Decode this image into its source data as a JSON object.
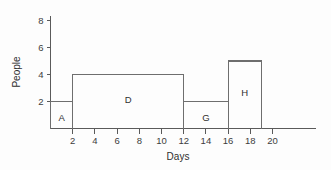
{
  "chart_data": {
    "type": "bar",
    "title": "",
    "subtitle": "",
    "xlabel": "Days",
    "ylabel": "People",
    "xlim": [
      0,
      21
    ],
    "ylim": [
      0,
      9
    ],
    "grid": false,
    "legend": false,
    "x_ticks": [
      2,
      4,
      6,
      8,
      10,
      12,
      14,
      16,
      18,
      20
    ],
    "x_tick_labels": [
      "2",
      "4",
      "6",
      "8",
      "10",
      "12",
      "14",
      "16",
      "18",
      "20"
    ],
    "y_ticks": [
      2,
      4,
      6,
      8
    ],
    "y_tick_labels": [
      "2",
      "4",
      "6",
      "8"
    ],
    "bars": [
      {
        "label": "A",
        "x_start": 0,
        "x_end": 2,
        "value": 2
      },
      {
        "label": "D",
        "x_start": 2,
        "x_end": 12,
        "value": 4
      },
      {
        "label": "G",
        "x_start": 12,
        "x_end": 16,
        "value": 2
      },
      {
        "label": "H",
        "x_start": 16,
        "x_end": 19,
        "value": 5
      }
    ],
    "categories": [
      "A",
      "D",
      "G",
      "H"
    ],
    "values": [
      2,
      4,
      2,
      5
    ],
    "colors": {
      "background": "#fdfdfd",
      "axis": "#5a5a5a",
      "bar_outline": "#6e6e6e",
      "bar_fill": "none",
      "text": "#2f2f2f"
    }
  }
}
